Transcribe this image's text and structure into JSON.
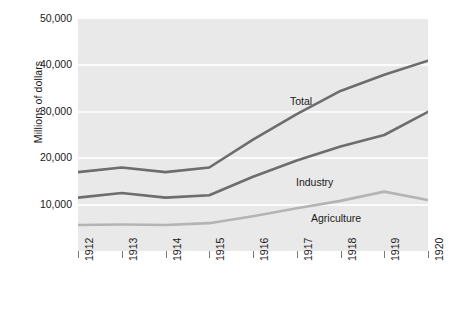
{
  "chart_data": {
    "type": "line",
    "title": "",
    "subtitle": "",
    "xlabel": "",
    "ylabel": "Millions of dollars",
    "categories": [
      "1912",
      "1913",
      "1914",
      "1915",
      "1916",
      "1917",
      "1918",
      "1919",
      "1920"
    ],
    "x": [
      1912,
      1913,
      1914,
      1915,
      1916,
      1917,
      1918,
      1919,
      1920
    ],
    "ylim": [
      0,
      50000
    ],
    "xlim": [
      1912,
      1920
    ],
    "y_ticks": [
      10000,
      20000,
      30000,
      40000,
      50000
    ],
    "y_tick_labels": [
      "10,000",
      "20,000",
      "30,000",
      "40,000",
      "50,000"
    ],
    "grid": true,
    "legend_position": "inline-annotations",
    "series": [
      {
        "name": "Total",
        "color": "#6d6d6d",
        "values": [
          17000,
          18000,
          17000,
          18000,
          24000,
          29500,
          34500,
          38000,
          41000
        ]
      },
      {
        "name": "Industry",
        "color": "#6d6d6d",
        "values": [
          11500,
          12500,
          11500,
          12000,
          16000,
          19500,
          22500,
          25000,
          30000
        ]
      },
      {
        "name": "Agriculture",
        "color": "#b4b4b4",
        "values": [
          5600,
          5700,
          5600,
          6000,
          7500,
          9200,
          10800,
          12800,
          11000
        ]
      }
    ],
    "annotations": [
      {
        "text": "Total",
        "x_px": 290,
        "y_px": 95
      },
      {
        "text": "Industry",
        "x_px": 296,
        "y_px": 176
      },
      {
        "text": "Agriculture",
        "x_px": 311,
        "y_px": 212
      }
    ],
    "colors": {
      "plot_background": "#e9e9e9",
      "gridline": "#fbfbfb",
      "page_background": "#ffffff",
      "text": "#1a1a1a",
      "total_line": "#6d6d6d",
      "industry_line": "#6d6d6d",
      "agriculture_line": "#b4b4b4"
    }
  }
}
